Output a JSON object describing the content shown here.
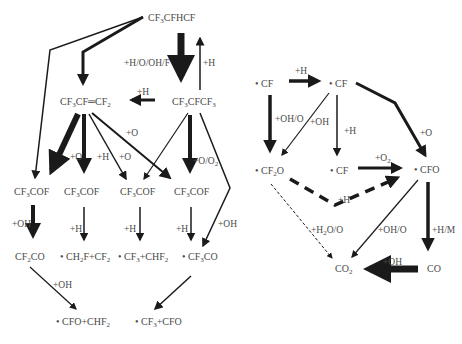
{
  "colors": {
    "arrow": "#1a1a1a",
    "text": "#4a4a4a",
    "background": "#ffffff"
  },
  "left_network": {
    "species": [
      {
        "id": "cf3cfhcf",
        "text": "CF3CFHCF",
        "x": 148,
        "y": 12
      },
      {
        "id": "cf3cf_cf2",
        "text": "CF3CF=CF2",
        "x": 60,
        "y": 96
      },
      {
        "id": "cf3cfcf3",
        "text": "CF3CFCF3",
        "x": 172,
        "y": 96
      },
      {
        "id": "cf3cof_1",
        "text": "CF3COF",
        "x": 14,
        "y": 186
      },
      {
        "id": "cf3cof_2",
        "text": "CF3COF",
        "x": 64,
        "y": 186
      },
      {
        "id": "cf3cof_3",
        "text": "CF3COF",
        "x": 120,
        "y": 186
      },
      {
        "id": "cf3cof_4",
        "text": "CF3COF",
        "x": 174,
        "y": 186
      },
      {
        "id": "cf2co",
        "text": "CF2CO",
        "x": 15,
        "y": 251
      },
      {
        "id": "ch2f_cf2",
        "text": "• CH2F+CF2",
        "x": 60,
        "y": 251
      },
      {
        "id": "cf3_chf2",
        "text": "• CF3+CHF2",
        "x": 118,
        "y": 251
      },
      {
        "id": "cf3co",
        "text": "• CF3CO",
        "x": 182,
        "y": 251
      },
      {
        "id": "cfo_chf2",
        "text": "• CFO+CHF2",
        "x": 56,
        "y": 316
      },
      {
        "id": "cf3_cfo",
        "text": "• CF3+CFO",
        "x": 135,
        "y": 316
      }
    ],
    "conditions": [
      {
        "text": "+H/O/OH/F",
        "x": 124,
        "y": 58
      },
      {
        "text": "+H",
        "x": 203,
        "y": 58
      },
      {
        "text": "+H",
        "x": 137,
        "y": 87
      },
      {
        "text": "+O",
        "x": 126,
        "y": 128
      },
      {
        "text": "+O",
        "x": 70,
        "y": 152
      },
      {
        "text": "+H",
        "x": 97,
        "y": 152
      },
      {
        "text": "+O",
        "x": 119,
        "y": 152
      },
      {
        "text": "+O/O2",
        "x": 193,
        "y": 156
      },
      {
        "text": "+OH",
        "x": 12,
        "y": 219
      },
      {
        "text": "+H",
        "x": 70,
        "y": 224
      },
      {
        "text": "+H",
        "x": 124,
        "y": 224
      },
      {
        "text": "+H",
        "x": 176,
        "y": 224
      },
      {
        "text": "+OH",
        "x": 218,
        "y": 219
      },
      {
        "text": "+OH",
        "x": 53,
        "y": 280
      }
    ]
  },
  "right_network": {
    "species": [
      {
        "id": "cf_1",
        "text": "• CF",
        "x": 255,
        "y": 78
      },
      {
        "id": "cf_2",
        "text": "• CF",
        "x": 329,
        "y": 78
      },
      {
        "id": "cf2o",
        "text": "• CF2O",
        "x": 255,
        "y": 165
      },
      {
        "id": "cf_3",
        "text": "• CF",
        "x": 330,
        "y": 165
      },
      {
        "id": "cfo",
        "text": "• CFO",
        "x": 414,
        "y": 164
      },
      {
        "id": "co2",
        "text": "CO2",
        "x": 335,
        "y": 263
      },
      {
        "id": "co",
        "text": "CO",
        "x": 427,
        "y": 263
      }
    ],
    "conditions": [
      {
        "text": "+H",
        "x": 295,
        "y": 66
      },
      {
        "text": "+OH/O",
        "x": 275,
        "y": 114
      },
      {
        "text": "+OH",
        "x": 310,
        "y": 117
      },
      {
        "text": "+H",
        "x": 344,
        "y": 126
      },
      {
        "text": "+O",
        "x": 420,
        "y": 128
      },
      {
        "text": "+O2",
        "x": 375,
        "y": 153
      },
      {
        "text": "+H",
        "x": 338,
        "y": 195
      },
      {
        "text": "+H2O/O",
        "x": 311,
        "y": 225
      },
      {
        "text": "+OH/O",
        "x": 378,
        "y": 225
      },
      {
        "text": "+H/M",
        "x": 432,
        "y": 225
      },
      {
        "text": "+OH",
        "x": 383,
        "y": 257
      }
    ]
  }
}
